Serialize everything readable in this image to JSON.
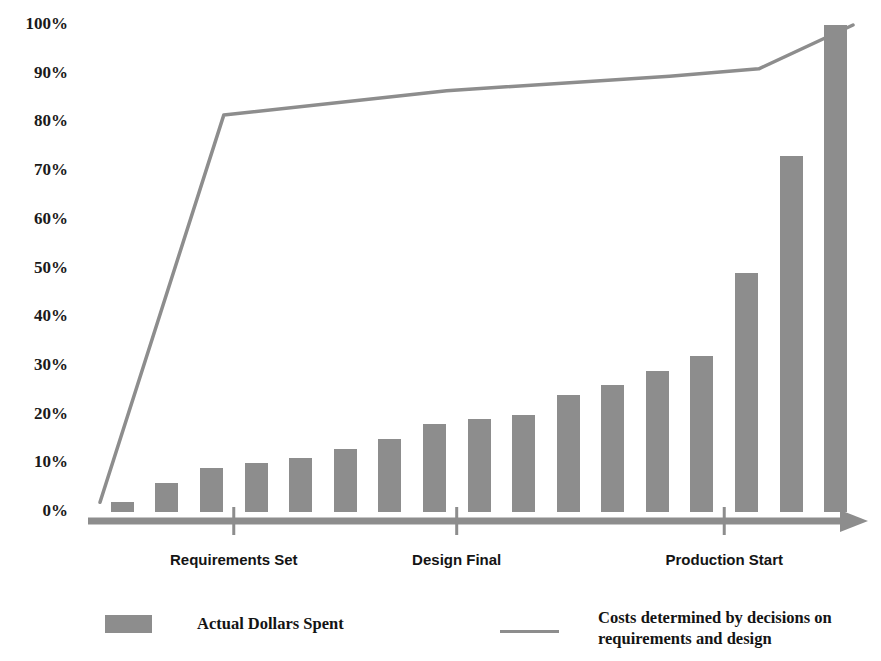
{
  "chart_data": {
    "type": "bar",
    "title": "",
    "subtitle": "",
    "xlabel": "",
    "ylabel": "",
    "ylim": [
      0,
      100
    ],
    "grid": false,
    "y_ticks": [
      "0%",
      "10%",
      "20%",
      "30%",
      "40%",
      "50%",
      "60%",
      "70%",
      "80%",
      "90%",
      "100%"
    ],
    "y_tick_values": [
      0,
      10,
      20,
      30,
      40,
      50,
      60,
      70,
      80,
      90,
      100
    ],
    "x_tick_labels": [
      "Requirements Set",
      "Design Final",
      "Production Start"
    ],
    "x_tick_positions": [
      2,
      7,
      13
    ],
    "categories": [
      "1",
      "2",
      "3",
      "4",
      "5",
      "6",
      "7",
      "8",
      "9",
      "10",
      "11",
      "12",
      "13",
      "14",
      "15",
      "16",
      "17"
    ],
    "series": [
      {
        "name": "Actual Dollars Spent",
        "type": "bar",
        "color": "#8d8d8d",
        "values": [
          2,
          6,
          9,
          10,
          11,
          13,
          15,
          18,
          19,
          20,
          24,
          26,
          29,
          32,
          49,
          73,
          100
        ]
      },
      {
        "name": "Costs determined by decisions on requirements and design",
        "type": "line",
        "color": "#8d8d8d",
        "x": [
          0,
          2,
          7,
          12,
          14,
          16
        ],
        "values": [
          2,
          81.5,
          86.5,
          89.5,
          91,
          100
        ]
      }
    ],
    "legend": {
      "position": "bottom",
      "entries": [
        {
          "label": "Actual Dollars Spent",
          "marker": "bar-swatch",
          "color": "#8d8d8d"
        },
        {
          "label": "Costs determined by decisions on\nrequirements and design",
          "marker": "line-swatch",
          "color": "#8d8d8d"
        }
      ]
    },
    "axis": {
      "arrow": true,
      "color": "#8d8d8d",
      "baseline_label": ""
    }
  },
  "colors": {
    "series": "#8d8d8d",
    "text": "#141414",
    "background": "#ffffff"
  }
}
